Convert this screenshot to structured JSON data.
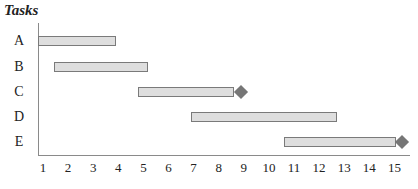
{
  "chart_data": {
    "type": "gantt",
    "title": "Tasks",
    "xlabel": "",
    "ylabel": "Tasks",
    "x_ticks": [
      "1",
      "2",
      "3",
      "4",
      "5",
      "6",
      "7",
      "8",
      "9",
      "10",
      "11",
      "12",
      "13",
      "14",
      "15"
    ],
    "xlim": [
      0.8,
      15.6
    ],
    "grid": false,
    "legend": null,
    "tasks": [
      {
        "name": "A",
        "start": 0.8,
        "end": 3.9,
        "milestone": null
      },
      {
        "name": "B",
        "start": 1.45,
        "end": 5.2,
        "milestone": null
      },
      {
        "name": "C",
        "start": 4.8,
        "end": 8.6,
        "milestone": 8.9
      },
      {
        "name": "D",
        "start": 6.9,
        "end": 12.7,
        "milestone": null
      },
      {
        "name": "E",
        "start": 10.6,
        "end": 15.05,
        "milestone": 15.3
      }
    ],
    "colors": {
      "bar_fill": "#dedede",
      "bar_border": "#7a7a7a",
      "milestone": "#767676",
      "axis": "#8a8a8a"
    }
  }
}
